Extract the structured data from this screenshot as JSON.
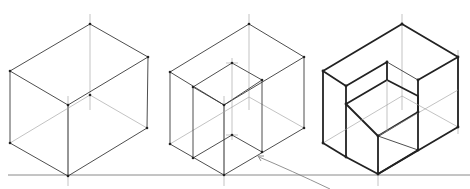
{
  "diagram": {
    "title": "",
    "figures": [
      {
        "id": "cube-1",
        "label": "Isometric box construction"
      },
      {
        "id": "cube-2",
        "label": "Box with inner construction lines"
      },
      {
        "id": "cube-3",
        "label": "Box with corner cut-out (darkened)"
      }
    ],
    "annotation": {
      "arrow_target": "inner bottom corner of cube 2",
      "text": ""
    },
    "colors": {
      "line": "#3a3a3a",
      "construction": "#9a9a9a",
      "bold": "#222222",
      "background": "#ffffff"
    }
  }
}
